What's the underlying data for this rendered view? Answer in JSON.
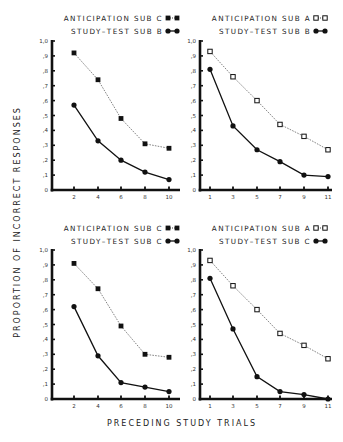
{
  "chart_data": [
    {
      "type": "line",
      "panel": "top-left",
      "x": [
        2,
        4,
        6,
        8,
        10
      ],
      "xticks": [
        "2",
        "4",
        "6",
        "8",
        "10"
      ],
      "yticks": [
        "0",
        ",1",
        ",2",
        ",3",
        ",4",
        ",5",
        ",6",
        ",7",
        ",8",
        ",9",
        "1,0"
      ],
      "ylim": [
        0,
        1.0
      ],
      "xlim": [
        0,
        11
      ],
      "series": [
        {
          "name": "ANTICIPATION SUB C",
          "marker": "filled-square",
          "line": "dotted",
          "values": [
            0.92,
            0.74,
            0.48,
            0.31,
            0.28
          ]
        },
        {
          "name": "STUDY-TEST SUB B",
          "marker": "filled-circle",
          "line": "solid",
          "values": [
            0.57,
            0.33,
            0.2,
            0.12,
            0.07
          ]
        }
      ]
    },
    {
      "type": "line",
      "panel": "top-right",
      "x": [
        1,
        3,
        5,
        7,
        9,
        11
      ],
      "xticks": [
        "1",
        "3",
        "5",
        "7",
        "9",
        "11"
      ],
      "yticks": [
        "0",
        ",1",
        ",2",
        ",3",
        ",4",
        ",5",
        ",6",
        ",7",
        ",8",
        ",9",
        "1,0"
      ],
      "ylim": [
        0,
        1.0
      ],
      "xlim": [
        0,
        11.5
      ],
      "series": [
        {
          "name": "ANTICIPATION SUB A",
          "marker": "open-square",
          "line": "dotted",
          "values": [
            0.93,
            0.76,
            0.6,
            0.44,
            0.36,
            0.27
          ]
        },
        {
          "name": "STUDY-TEST SUB B",
          "marker": "filled-circle",
          "line": "solid",
          "values": [
            0.81,
            0.43,
            0.27,
            0.19,
            0.1,
            0.09
          ]
        }
      ]
    },
    {
      "type": "line",
      "panel": "bottom-left",
      "x": [
        2,
        4,
        6,
        8,
        10
      ],
      "xticks": [
        "2",
        "4",
        "6",
        "8",
        "10"
      ],
      "yticks": [
        "0",
        ",1",
        ",2",
        ",3",
        ",4",
        ",5",
        ",6",
        ",7",
        ",8",
        ",9",
        "1,0"
      ],
      "ylim": [
        0,
        1.0
      ],
      "xlim": [
        0,
        11
      ],
      "series": [
        {
          "name": "ANTICIPATION SUB C",
          "marker": "filled-square",
          "line": "dotted",
          "values": [
            0.91,
            0.74,
            0.49,
            0.3,
            0.28
          ]
        },
        {
          "name": "STUDY-TEST SUB C",
          "marker": "filled-circle",
          "line": "solid",
          "values": [
            0.62,
            0.29,
            0.11,
            0.08,
            0.05
          ]
        }
      ]
    },
    {
      "type": "line",
      "panel": "bottom-right",
      "x": [
        1,
        3,
        5,
        7,
        9,
        11
      ],
      "xticks": [
        "1",
        "3",
        "5",
        "7",
        "9",
        "11"
      ],
      "yticks": [
        "0",
        ",1",
        ",2",
        ",3",
        ",4",
        ",5",
        ",6",
        ",7",
        ",8",
        ",9",
        "1,0"
      ],
      "ylim": [
        0,
        1.0
      ],
      "xlim": [
        0,
        11.5
      ],
      "series": [
        {
          "name": "ANTICIPATION SUB A",
          "marker": "open-square",
          "line": "dotted",
          "values": [
            0.93,
            0.76,
            0.6,
            0.44,
            0.36,
            0.27
          ]
        },
        {
          "name": "STUDY-TEST SUB C",
          "marker": "filled-circle",
          "line": "solid",
          "values": [
            0.81,
            0.47,
            0.15,
            0.05,
            0.03,
            0.0
          ]
        }
      ]
    }
  ],
  "labels": {
    "ylabel": "PROPORTION OF INCORRECT RESPONSES",
    "xlabel": "PRECEDING STUDY TRIALS"
  },
  "colors": {
    "ink": "#111111",
    "dotted": "#777777"
  }
}
